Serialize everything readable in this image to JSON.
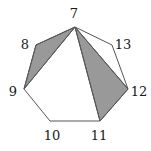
{
  "figure": {
    "type": "geometric-diagram",
    "shape": "heptagon",
    "size": {
      "width": 151,
      "height": 151
    },
    "background_color": "#ffffff",
    "outline_color": "#555555",
    "shaded_fill_color": "#999999",
    "label_color": "#1a1a1a",
    "stroke_width": 1,
    "vertices": [
      {
        "id": "v7",
        "label": "7",
        "x": 75,
        "y": 27,
        "label_x": 74,
        "label_y": 13
      },
      {
        "id": "v8",
        "label": "8",
        "x": 36,
        "y": 45,
        "label_x": 25,
        "label_y": 44
      },
      {
        "id": "v9",
        "label": "9",
        "x": 24,
        "y": 89,
        "label_x": 13,
        "label_y": 91
      },
      {
        "id": "v10",
        "label": "10",
        "x": 50,
        "y": 121,
        "label_x": 52,
        "label_y": 135
      },
      {
        "id": "v11",
        "label": "11",
        "x": 100,
        "y": 121,
        "label_x": 99,
        "label_y": 135
      },
      {
        "id": "v12",
        "label": "12",
        "x": 128,
        "y": 89,
        "label_x": 139,
        "label_y": 91
      },
      {
        "id": "v13",
        "label": "13",
        "x": 112,
        "y": 45,
        "label_x": 123,
        "label_y": 44
      }
    ],
    "perimeter_order": [
      "v7",
      "v8",
      "v9",
      "v10",
      "v11",
      "v12",
      "v13"
    ],
    "shaded_triangles": [
      {
        "id": "triangle-7-8-9",
        "vertices": [
          "v7",
          "v8",
          "v9"
        ]
      },
      {
        "id": "triangle-7-11-12",
        "vertices": [
          "v7",
          "v11",
          "v12"
        ]
      }
    ],
    "diagonals": [
      {
        "id": "diagonal-7-9",
        "from": "v7",
        "to": "v9"
      },
      {
        "id": "diagonal-7-11",
        "from": "v7",
        "to": "v11"
      },
      {
        "id": "diagonal-7-12",
        "from": "v7",
        "to": "v12"
      }
    ]
  }
}
